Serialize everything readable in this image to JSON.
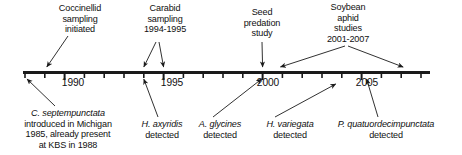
{
  "figure": {
    "kind": "timeline",
    "line_color": "#1a1a1a",
    "text_color": "#101010",
    "background": "#ffffff",
    "axis": {
      "start_year": 1988,
      "end_year": 2008,
      "tick_interval_years": 1,
      "labeled_ticks": [
        {
          "year": 1990,
          "label": "1990"
        },
        {
          "year": 1995,
          "label": "1995"
        },
        {
          "year": 2000,
          "label": "2000"
        },
        {
          "year": 2005,
          "label": "2005"
        }
      ]
    },
    "events_above": [
      {
        "id": "coccinellid-sampling",
        "lines": [
          "Coccinellid",
          "sampling",
          "initiated"
        ],
        "pointers": [
          1989
        ]
      },
      {
        "id": "carabid-sampling",
        "lines": [
          "Carabid",
          "sampling",
          "1994-1995"
        ],
        "pointers": [
          1994,
          1995
        ]
      },
      {
        "id": "seed-predation-study",
        "lines": [
          "Seed",
          "predation",
          "study"
        ],
        "pointers": [
          2000
        ]
      },
      {
        "id": "soybean-aphid-studies",
        "lines": [
          "Soybean",
          "aphid",
          "studies",
          "2001-2007"
        ],
        "pointers": [
          2001,
          2007
        ]
      }
    ],
    "events_below": [
      {
        "id": "c-septempunctata",
        "species": "C. septempunctata",
        "lines": [
          "introduced in Michigan",
          "1985, already present",
          "at KBS in 1988"
        ],
        "pointers": [
          1988
        ]
      },
      {
        "id": "h-axyridis",
        "species": "H. axyridis",
        "lines": [
          "detected"
        ],
        "pointers": [
          1994
        ]
      },
      {
        "id": "a-glycines",
        "species": "A. glycines",
        "lines": [
          "detected"
        ],
        "pointers": [
          2000
        ]
      },
      {
        "id": "h-variegata",
        "species": "H. variegata",
        "lines": [
          "detected"
        ],
        "pointers": [
          2004
        ]
      },
      {
        "id": "p-quatuordecimpunctata",
        "species": "P. quatuordecimpunctata",
        "lines": [
          "detected"
        ],
        "pointers": [
          2005
        ]
      }
    ]
  }
}
